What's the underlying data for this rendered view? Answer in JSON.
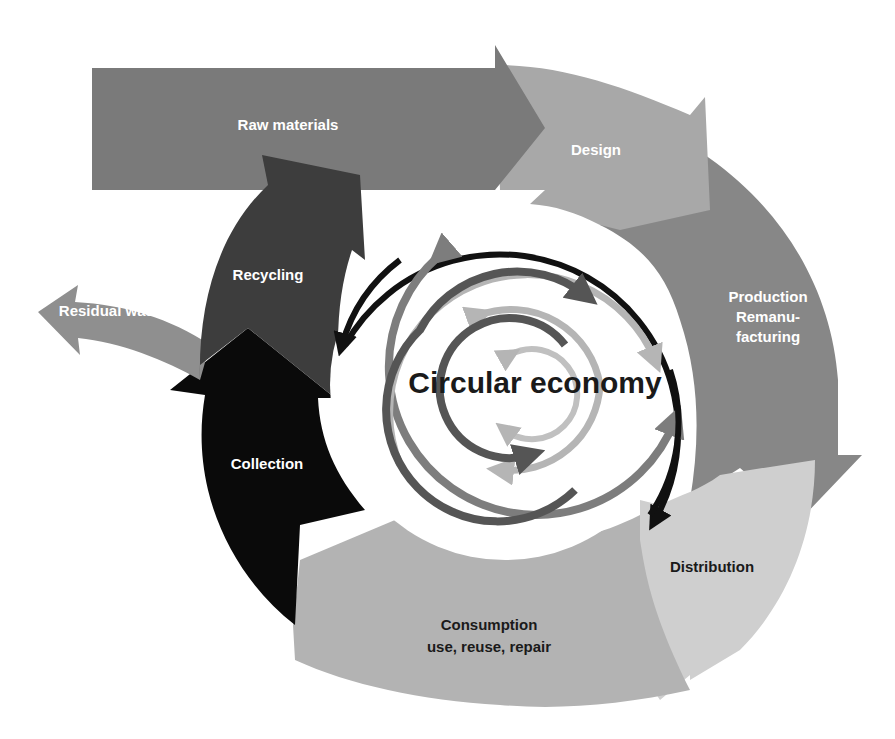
{
  "diagram": {
    "title": "Circular economy",
    "stages": {
      "raw_materials": "Raw materials",
      "design": "Design",
      "production_line1": "Production",
      "production_line2": "Remanu-",
      "production_line3": "facturing",
      "distribution": "Distribution",
      "consumption_line1": "Consumption",
      "consumption_line2": "use, reuse, repair",
      "collection": "Collection",
      "recycling": "Recycling",
      "residual_waste": "Residual waste"
    },
    "colors": {
      "raw_materials": "#7a7a7a",
      "design": "#a8a8a8",
      "production": "#878787",
      "distribution": "#cfcfcf",
      "consumption": "#b3b3b3",
      "collection": "#0a0a0a",
      "recycling": "#3d3d3d",
      "residual_waste": "#8f8f8f",
      "inner_black": "#111111",
      "inner_mid": "#7d7d7d",
      "inner_light": "#b5b5b5",
      "inner_dark": "#555555"
    }
  }
}
